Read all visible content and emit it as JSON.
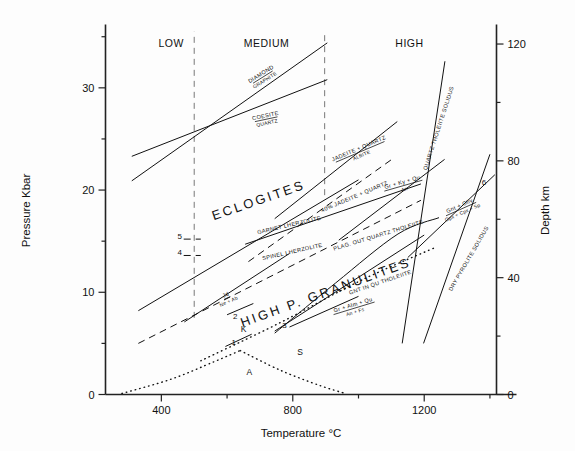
{
  "figure": {
    "background": "#fdfdfd",
    "ink": "#111111"
  },
  "axes": {
    "left": {
      "title": "Pressure Kbar",
      "ticks_major": [
        "0",
        "10",
        "20",
        "30"
      ],
      "ticks_major_values": [
        0,
        10,
        20,
        30
      ],
      "ticks_minor_values": [
        5,
        15,
        25,
        35
      ],
      "range": [
        0,
        36
      ]
    },
    "right": {
      "title": "Depth km",
      "ticks_major": [
        "0",
        "40",
        "80",
        "120"
      ],
      "ticks_major_values": [
        0,
        40,
        80,
        120
      ],
      "ticks_minor_values": [
        20,
        60,
        100
      ],
      "range": [
        0,
        126
      ]
    },
    "bottom": {
      "title": "Temperature °C",
      "ticks_major": [
        "400",
        "800",
        "1200"
      ],
      "ticks_major_values": [
        400,
        800,
        1200
      ],
      "ticks_minor_values": [
        200,
        600,
        1000,
        1400
      ],
      "range": [
        230,
        1420
      ]
    }
  },
  "chart_data": {
    "type": "line",
    "title": "",
    "xlabel": "Temperature °C",
    "ylabel": "Pressure Kbar",
    "y2label": "Depth km",
    "xlim": [
      230,
      1420
    ],
    "ylim": [
      0,
      36
    ],
    "y2lim": [
      0,
      126
    ],
    "grid": false,
    "legend": "none",
    "zone_labels": [
      {
        "text": "LOW",
        "x": 430,
        "y": 34.0
      },
      {
        "text": "MEDIUM",
        "x": 720,
        "y": 34.0
      },
      {
        "text": "HIGH",
        "x": 1155,
        "y": 34.0
      }
    ],
    "field_labels": [
      {
        "text": "ECLOGITES",
        "x": 700,
        "y": 18.6,
        "rotation": -19
      },
      {
        "text": "HIGH P. GRANULITES",
        "x": 905,
        "y": 9.6,
        "rotation": -20
      }
    ],
    "reaction_labels": [
      {
        "text": "DIAMOND",
        "x": 706,
        "y": 31.2,
        "rotation": -32,
        "sub": "GRAPHITE"
      },
      {
        "text": "COESITE",
        "x": 718,
        "y": 27.1,
        "rotation": -12,
        "sub": "QUARTZ"
      },
      {
        "text": "JADEITE + QUARTZ",
        "x": 1003,
        "y": 23.9,
        "rotation": -23,
        "sub": "ALBITE"
      },
      {
        "text": "40% JADEITE + QUARTZ",
        "x": 990,
        "y": 19.2,
        "rotation": -23,
        "sub": ""
      },
      {
        "text": "Gr + Ky + Qu",
        "x": 1135,
        "y": 20.6,
        "rotation": -16,
        "sub": "An"
      },
      {
        "text": "QUARTZ THOLEIITE SOLIDUS",
        "x": 1249,
        "y": 26.0,
        "rotation": -72,
        "sub": ""
      },
      {
        "text": "PLAG. OUT QUARTZ THOLEIITE",
        "x": 1062,
        "y": 15.4,
        "rotation": -17,
        "sub": ""
      },
      {
        "text": "GARNET LHERZOLITE",
        "x": 790,
        "y": 16.4,
        "rotation": -13,
        "sub": ""
      },
      {
        "text": "SPINEL LHERZOLITE",
        "x": 800,
        "y": 13.8,
        "rotation": -13,
        "sub": ""
      },
      {
        "text": "GNT IN QU THOLEIITE",
        "x": 1068,
        "y": 10.8,
        "rotation": -19,
        "sub": ""
      },
      {
        "text": "Gnt + Oliv",
        "x": 1310,
        "y": 18.3,
        "rotation": -24,
        "sub": "Opx + Cpx + Sp"
      },
      {
        "text": "DRY PYROLITE SOLIDUS",
        "x": 1340,
        "y": 13.2,
        "rotation": -60,
        "sub": ""
      },
      {
        "text": "Jd",
        "x": 598,
        "y": 9.6,
        "rotation": -24,
        "sub": "Ne + Ab"
      },
      {
        "text": "Gr + Alm + Qu",
        "x": 985,
        "y": 8.6,
        "rotation": -17,
        "sub": "An + Fs"
      }
    ],
    "number_labels": [
      {
        "text": "1",
        "x": 620,
        "y": 4.8
      },
      {
        "text": "2",
        "x": 625,
        "y": 7.4
      },
      {
        "text": "3",
        "x": 775,
        "y": 6.5
      },
      {
        "text": "4",
        "x": 456,
        "y": 13.6
      },
      {
        "text": "5",
        "x": 456,
        "y": 15.2
      },
      {
        "text": "6",
        "x": 1382,
        "y": 20.5
      }
    ],
    "letter_labels": [
      {
        "text": "K",
        "x": 650,
        "y": 6.1
      },
      {
        "text": "S",
        "x": 822,
        "y": 3.9
      },
      {
        "text": "A",
        "x": 668,
        "y": 1.9
      }
    ],
    "guide_lines": [
      {
        "name": "low-medium-boundary",
        "x": 500,
        "y0": 7.5,
        "y1": 35.5
      },
      {
        "name": "medium-high-boundary",
        "x": 897,
        "y0": 19.5,
        "y1": 35.5
      }
    ],
    "series": [
      {
        "name": "diamond-graphite",
        "style": "solid",
        "points": [
          [
            310,
            20.9
          ],
          [
            905,
            34.4
          ]
        ]
      },
      {
        "name": "coesite-quartz",
        "style": "solid",
        "points": [
          [
            310,
            23.3
          ],
          [
            905,
            30.8
          ]
        ]
      },
      {
        "name": "jadeite-quartz-albite",
        "style": "solid",
        "points": [
          [
            745,
            17.2
          ],
          [
            1118,
            26.7
          ]
        ]
      },
      {
        "name": "forty-percent-jadeite-quartz",
        "style": "dashed",
        "points": [
          [
            665,
            13.0
          ],
          [
            1110,
            23.2
          ]
        ]
      },
      {
        "name": "gr-ky-qu-an",
        "style": "solid",
        "points": [
          [
            940,
            15.1
          ],
          [
            1262,
            23.0
          ]
        ]
      },
      {
        "name": "eclogite-lower-bound",
        "style": "solid",
        "points": [
          [
            330,
            8.2
          ],
          [
            1000,
            21.0
          ]
        ]
      },
      {
        "name": "garnet-lherzolite",
        "style": "solid",
        "points": [
          [
            655,
            14.7
          ],
          [
            1190,
            20.6
          ]
        ]
      },
      {
        "name": "spinel-lherzolite",
        "style": "dashed",
        "points": [
          [
            330,
            5.0
          ],
          [
            1190,
            19.0
          ]
        ]
      },
      {
        "name": "jd-ne-ab",
        "style": "solid",
        "points": [
          [
            470,
            7.1
          ],
          [
            790,
            13.8
          ]
        ]
      },
      {
        "name": "gr-alm-qu-an-fs",
        "style": "solid",
        "points": [
          [
            745,
            6.2
          ],
          [
            1200,
            15.6
          ]
        ]
      },
      {
        "name": "plag-out-quartz-tholeiite",
        "style": "solid",
        "points": [
          [
            745,
            6.0
          ],
          [
            930,
            10.9
          ],
          [
            1120,
            15.7
          ],
          [
            1245,
            17.3
          ]
        ]
      },
      {
        "name": "gnt-in-qu-tholeiite",
        "style": "dotted",
        "points": [
          [
            520,
            3.3
          ],
          [
            760,
            7.0
          ],
          [
            1010,
            11.2
          ],
          [
            1235,
            14.4
          ]
        ]
      },
      {
        "name": "quartz-tholeiite-solidus",
        "style": "solid",
        "points": [
          [
            1133,
            5.0
          ],
          [
            1263,
            32.6
          ]
        ]
      },
      {
        "name": "dry-pyrolite-solidus",
        "style": "solid",
        "points": [
          [
            1198,
            5.0
          ],
          [
            1400,
            23.5
          ]
        ]
      },
      {
        "name": "gnt-oliv-opx-cpx-sp",
        "style": "solid",
        "points": [
          [
            1150,
            13.4
          ],
          [
            1415,
            21.5
          ]
        ]
      },
      {
        "name": "curve-1-K",
        "style": "solid",
        "points": [
          [
            595,
            4.7
          ],
          [
            675,
            5.9
          ]
        ]
      },
      {
        "name": "curve-2",
        "style": "solid",
        "points": [
          [
            600,
            7.8
          ],
          [
            680,
            8.9
          ]
        ]
      },
      {
        "name": "curve-3",
        "style": "solid",
        "points": [
          [
            790,
            6.6
          ],
          [
            1000,
            9.6
          ]
        ]
      },
      {
        "name": "geotherm-A-rising",
        "style": "dotted",
        "points": [
          [
            280,
            0.1
          ],
          [
            430,
            1.5
          ],
          [
            560,
            3.2
          ],
          [
            640,
            4.3
          ]
        ]
      },
      {
        "name": "geotherm-A-falling",
        "style": "dotted",
        "points": [
          [
            640,
            4.3
          ],
          [
            760,
            2.4
          ],
          [
            880,
            0.9
          ],
          [
            960,
            0.1
          ]
        ]
      }
    ]
  }
}
